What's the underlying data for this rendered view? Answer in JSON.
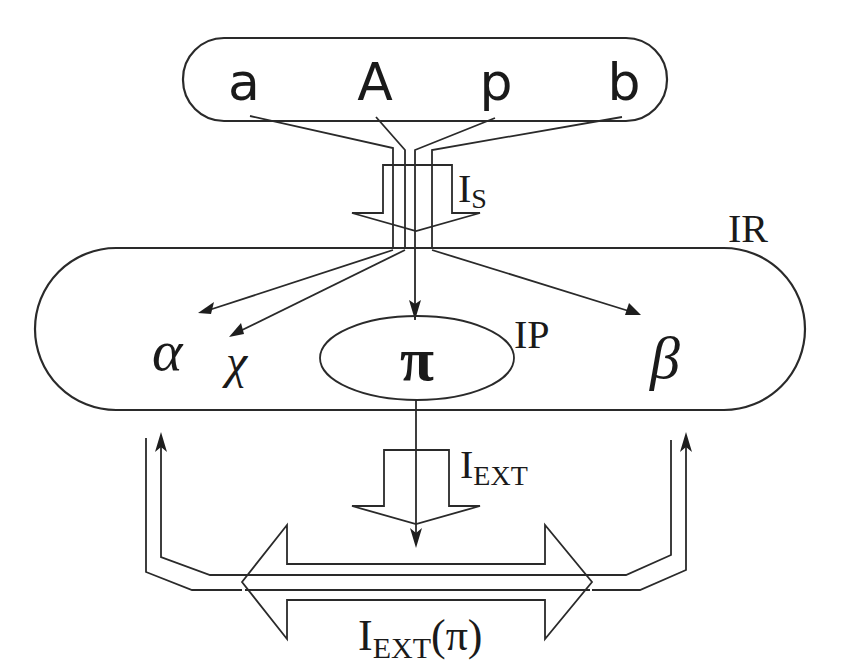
{
  "diagram": {
    "top_box": {
      "label": "inputs",
      "items": [
        "a",
        "A",
        "p",
        "b"
      ]
    },
    "labels": {
      "is_main": "I",
      "is_sub": "S",
      "ir": "IR",
      "ip": "IP",
      "iext_main": "I",
      "iext_sub": "EXT",
      "iextpi_main": "I",
      "iextpi_sub": "EXT",
      "iextpi_arg": "(π)"
    },
    "ir_region": {
      "symbols": {
        "alpha": "α",
        "chi": "χ",
        "pi": "π",
        "beta": "β"
      }
    },
    "colors": {
      "line": "#2a2a2a",
      "text": "#1a1a1a",
      "background": "#ffffff"
    }
  }
}
